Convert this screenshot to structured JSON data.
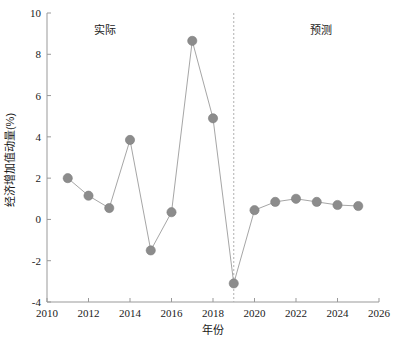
{
  "chart_data": {
    "type": "line",
    "title": "",
    "xlabel": "年份",
    "ylabel": "经济增加值动量(%)",
    "xlim": [
      2010,
      2026
    ],
    "ylim": [
      -4,
      10
    ],
    "xticks": [
      2010,
      2012,
      2014,
      2016,
      2018,
      2020,
      2022,
      2024,
      2026
    ],
    "yticks": [
      -4,
      -2,
      0,
      2,
      4,
      6,
      8,
      10
    ],
    "xtick_labels": [
      "2010",
      "2012",
      "2014",
      "2016",
      "2018",
      "2020",
      "2022",
      "2024",
      "2026"
    ],
    "ytick_labels": [
      "-4",
      "-2",
      "0",
      "2",
      "4",
      "6",
      "8",
      "10"
    ],
    "grid": false,
    "legend": "none",
    "marker": "circle",
    "marker_color": "#8c8c8c",
    "line_color": "#a6a6a6",
    "series": [
      {
        "name": "经济增加值动量",
        "x": [
          2011,
          2012,
          2013,
          2014,
          2015,
          2016,
          2017,
          2018,
          2019,
          2020,
          2021,
          2022,
          2023,
          2024,
          2025
        ],
        "values": [
          2.0,
          1.15,
          0.55,
          3.85,
          -1.5,
          0.35,
          8.65,
          4.9,
          -3.1,
          0.45,
          0.85,
          1.0,
          0.85,
          0.7,
          0.65
        ]
      }
    ],
    "annotations": [
      {
        "name": "actual-region-label",
        "text": "实际",
        "x": 2012.8,
        "y": 9.0
      },
      {
        "name": "forecast-region-label",
        "text": "预测",
        "x": 2023.2,
        "y": 9.0
      }
    ],
    "divider": {
      "name": "forecast-divider",
      "x": 2019,
      "style": "dashed",
      "color": "#b0b0b0"
    }
  }
}
